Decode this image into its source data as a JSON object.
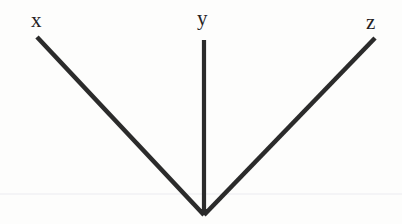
{
  "figure": {
    "background_color": "#fdfdfc",
    "stroke_color": "#2b2b2b",
    "stroke_width": 4.5,
    "artifact_line_color": "#ececef",
    "canvas": {
      "width": 402,
      "height": 224
    },
    "vertex": {
      "x": 204,
      "y": 215
    },
    "rays": [
      {
        "id": "ray-x",
        "label": "x",
        "label_position": {
          "x": 31,
          "y": 10
        },
        "endpoint": {
          "x": 37,
          "y": 37
        }
      },
      {
        "id": "ray-y",
        "label": "y",
        "label_position": {
          "x": 197,
          "y": 8
        },
        "endpoint": {
          "x": 204,
          "y": 40
        }
      },
      {
        "id": "ray-z",
        "label": "z",
        "label_position": {
          "x": 366,
          "y": 12
        },
        "endpoint": {
          "x": 375,
          "y": 38
        }
      }
    ],
    "artifact_line": {
      "y": 194,
      "x1": 0,
      "x2": 402
    }
  }
}
